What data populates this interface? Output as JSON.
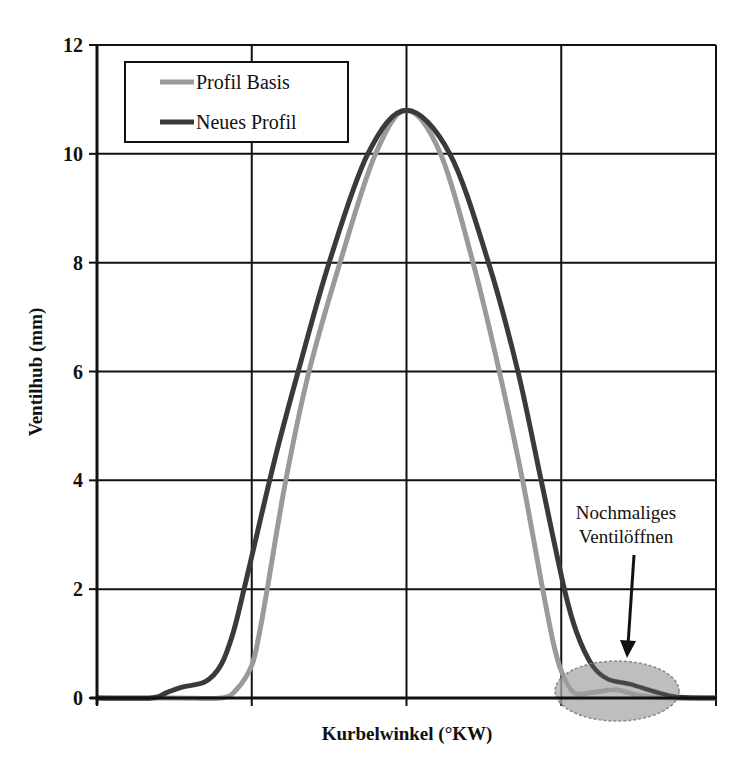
{
  "chart_data": {
    "type": "line",
    "title": "",
    "xlabel": "Kurbelwinkel (°KW)",
    "ylabel": "Ventilhub (mm)",
    "ylim": [
      0,
      12
    ],
    "xlim": [
      0,
      4
    ],
    "x_tick_labels_shown": false,
    "y_ticks": [
      0,
      2,
      4,
      6,
      8,
      10,
      12
    ],
    "y_tick_labels": [
      "0",
      "2",
      "4",
      "6",
      "8",
      "10",
      "12"
    ],
    "grid": true,
    "legend_position": "upper-left",
    "series": [
      {
        "name": "Profil Basis",
        "color": "#9a9a9a",
        "x": [
          0,
          0.5,
          0.8,
          0.9,
          1.0,
          1.05,
          1.1,
          1.22,
          1.37,
          1.57,
          1.8,
          2.0,
          2.22,
          2.43,
          2.6,
          2.75,
          2.88,
          2.95,
          3.0,
          3.08,
          3.2,
          3.35,
          3.5,
          3.7,
          4.0
        ],
        "y": [
          0,
          0,
          0,
          0.15,
          0.6,
          1.2,
          2.0,
          4.0,
          6.0,
          8.0,
          10.0,
          10.8,
          10.0,
          8.0,
          6.0,
          4.0,
          2.0,
          1.0,
          0.5,
          0.1,
          0.1,
          0.15,
          0.05,
          0,
          0
        ]
      },
      {
        "name": "Neues Profil",
        "color": "#3a3a3a",
        "x": [
          0,
          0.35,
          0.45,
          0.55,
          0.7,
          0.8,
          0.88,
          0.95,
          1.0,
          1.15,
          1.3,
          1.5,
          1.75,
          2.0,
          2.28,
          2.53,
          2.72,
          2.87,
          3.02,
          3.1,
          3.2,
          3.3,
          3.45,
          3.6,
          3.75,
          4.0
        ],
        "y": [
          0,
          0,
          0.1,
          0.2,
          0.3,
          0.6,
          1.2,
          2.0,
          2.6,
          4.4,
          6.0,
          8.0,
          10.0,
          10.8,
          10.0,
          8.0,
          6.0,
          4.0,
          2.0,
          1.2,
          0.6,
          0.35,
          0.25,
          0.12,
          0.02,
          0
        ]
      }
    ],
    "annotations": [
      {
        "text": "Nochmaliges Ventilöffnen",
        "type": "arrow-with-ellipse",
        "target_x": 3.3,
        "target_y": 0.1
      }
    ]
  },
  "legend": {
    "items": [
      {
        "label": "Profil Basis",
        "color": "#9a9a9a"
      },
      {
        "label": "Neues Profil",
        "color": "#3a3a3a"
      }
    ]
  },
  "axes": {
    "x_title": "Kurbelwinkel (°KW)",
    "y_title": "Ventilhub (mm)"
  },
  "annotation": {
    "line1": "Nochmaliges",
    "line2": "Ventilöffnen"
  }
}
